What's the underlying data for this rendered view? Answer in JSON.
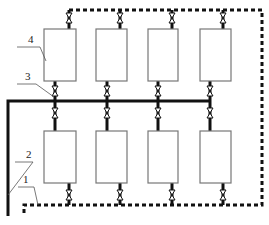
{
  "diagram": {
    "type": "piping-schematic",
    "labels": [
      {
        "id": "1",
        "text": "1",
        "x": 23,
        "y": 183,
        "leader": [
          [
            18,
            187
          ],
          [
            34,
            187
          ],
          [
            38,
            205
          ]
        ]
      },
      {
        "id": "2",
        "text": "2",
        "x": 26,
        "y": 158,
        "leader": [
          [
            15,
            162
          ],
          [
            33,
            162
          ],
          [
            8,
            195
          ]
        ]
      },
      {
        "id": "3",
        "text": "3",
        "x": 25,
        "y": 80,
        "leader": [
          [
            17,
            84
          ],
          [
            36,
            84
          ],
          [
            54,
            97
          ]
        ]
      },
      {
        "id": "4",
        "text": "4",
        "x": 28,
        "y": 43,
        "leader": [
          [
            17,
            47
          ],
          [
            40,
            47
          ],
          [
            46,
            61
          ]
        ]
      }
    ],
    "colors": {
      "line": "#111111",
      "box": "#777777",
      "background": "#ffffff"
    },
    "columns": [
      {
        "box_x": 44,
        "box_w": 32,
        "inlet_x": 55,
        "outlet_x": 69
      },
      {
        "box_x": 96,
        "box_w": 31,
        "inlet_x": 107,
        "outlet_x": 120
      },
      {
        "box_x": 148,
        "box_w": 30,
        "inlet_x": 158,
        "outlet_x": 172
      },
      {
        "box_x": 200,
        "box_w": 31,
        "inlet_x": 210,
        "outlet_x": 223
      }
    ],
    "rows": [
      {
        "name": "upper",
        "box_y": 29,
        "box_h": 52
      },
      {
        "name": "lower",
        "box_y": 131,
        "box_h": 52
      }
    ],
    "pipes": {
      "solid_header_y": 101,
      "solid_header_x1": 8,
      "solid_header_x2": 210,
      "solid_riser_x": 8,
      "solid_riser_bottom": 216,
      "dashed_top_y": 10,
      "dashed_bottom_y": 205,
      "dashed_right_x": 262,
      "dashed_left_x": 24,
      "dashed_left_bottom": 216
    }
  }
}
